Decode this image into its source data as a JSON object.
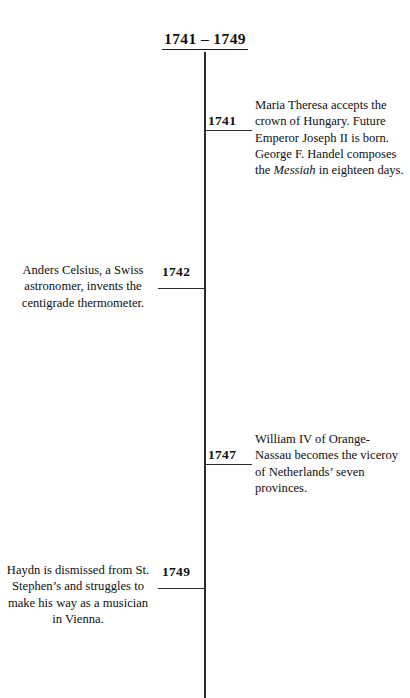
{
  "title": "1741 – 1749",
  "axis": {
    "color": "#2b2b2b",
    "orientation": "vertical"
  },
  "entries": [
    {
      "year": "1741",
      "side": "right",
      "text_before_italic": "Maria Theresa accepts the crown of Hungary. Future Emperor Joseph II is born. George F. Handel composes the ",
      "italic": "Messiah",
      "text_after_italic": " in eighteen days."
    },
    {
      "year": "1742",
      "side": "left",
      "text": "Anders Celsius, a Swiss astronomer, invents the centigrade thermometer."
    },
    {
      "year": "1747",
      "side": "right",
      "text": "William IV of Orange-Nassau becomes the viceroy of Netherlands’ seven provinces."
    },
    {
      "year": "1749",
      "side": "left",
      "text": "Haydn is dismissed from St. Stephen’s and struggles to make his way as a musician  in Vienna."
    }
  ]
}
